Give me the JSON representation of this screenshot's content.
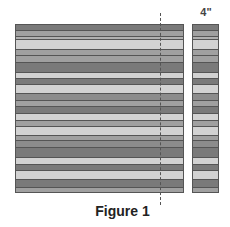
{
  "figure": {
    "caption": "Figure 1",
    "width_label": "4\"",
    "colors": {
      "dark": "#7a7a7a",
      "medium_dark": "#8c8c8c",
      "medium": "#a0a0a0",
      "medium_light": "#b0b0b0",
      "light": "#d2d2d2",
      "border": "#555555"
    },
    "stripes": [
      {
        "top": 0,
        "height": 6,
        "tone": "dark"
      },
      {
        "top": 6,
        "height": 6,
        "tone": "medium"
      },
      {
        "top": 12,
        "height": 3,
        "tone": "medium_light"
      },
      {
        "top": 15,
        "height": 10,
        "tone": "light"
      },
      {
        "top": 25,
        "height": 6,
        "tone": "medium"
      },
      {
        "top": 31,
        "height": 7,
        "tone": "medium"
      },
      {
        "top": 38,
        "height": 10,
        "tone": "dark"
      },
      {
        "top": 48,
        "height": 6,
        "tone": "light"
      },
      {
        "top": 54,
        "height": 6,
        "tone": "dark"
      },
      {
        "top": 60,
        "height": 9,
        "tone": "light"
      },
      {
        "top": 69,
        "height": 7,
        "tone": "medium_dark"
      },
      {
        "top": 76,
        "height": 6,
        "tone": "medium"
      },
      {
        "top": 82,
        "height": 7,
        "tone": "dark"
      },
      {
        "top": 89,
        "height": 7,
        "tone": "light"
      },
      {
        "top": 96,
        "height": 6,
        "tone": "medium"
      },
      {
        "top": 102,
        "height": 9,
        "tone": "light"
      },
      {
        "top": 111,
        "height": 5,
        "tone": "medium"
      },
      {
        "top": 116,
        "height": 7,
        "tone": "medium_dark"
      },
      {
        "top": 123,
        "height": 10,
        "tone": "dark"
      },
      {
        "top": 133,
        "height": 7,
        "tone": "light"
      },
      {
        "top": 140,
        "height": 6,
        "tone": "dark"
      },
      {
        "top": 146,
        "height": 9,
        "tone": "light"
      },
      {
        "top": 155,
        "height": 8,
        "tone": "dark"
      },
      {
        "top": 163,
        "height": 6,
        "tone": "medium"
      }
    ]
  }
}
